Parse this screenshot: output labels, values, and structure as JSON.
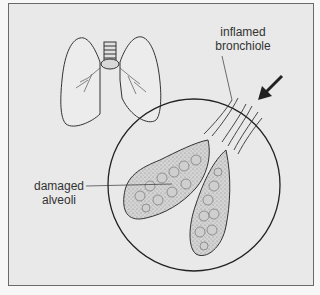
{
  "figure": {
    "background_color": "#e9e9e9",
    "border_color": "#6a6a6a",
    "labels": [
      {
        "id": "bronchiole",
        "line1": "inflamed",
        "line2": "bronchiole"
      },
      {
        "id": "alveoli",
        "line1": "damaged",
        "line2": "alveoli"
      }
    ],
    "icons": {
      "arrow": "airflow-arrow",
      "lungs": "lungs-outline",
      "magnifier": "magnification-circle"
    }
  }
}
